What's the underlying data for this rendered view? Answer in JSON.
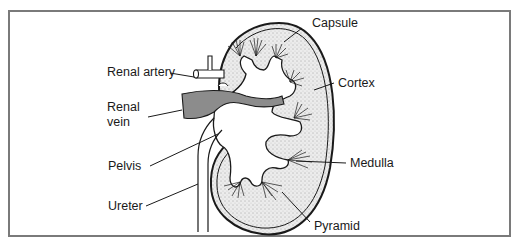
{
  "diagram": {
    "labels": {
      "capsule": "Capsule",
      "cortex": "Cortex",
      "medulla": "Medulla",
      "pyramid": "Pyramid",
      "renal_artery": "Renal artery",
      "renal_vein_line1": "Renal",
      "renal_vein_line2": "vein",
      "pelvis": "Pelvis",
      "ureter": "Ureter"
    },
    "colors": {
      "frame_border": "#7a7a7a",
      "outline": "#1a1a1a",
      "cortex_fill": "#e6e6e6",
      "vein_fill": "#8c8c8c",
      "background": "#ffffff"
    }
  }
}
